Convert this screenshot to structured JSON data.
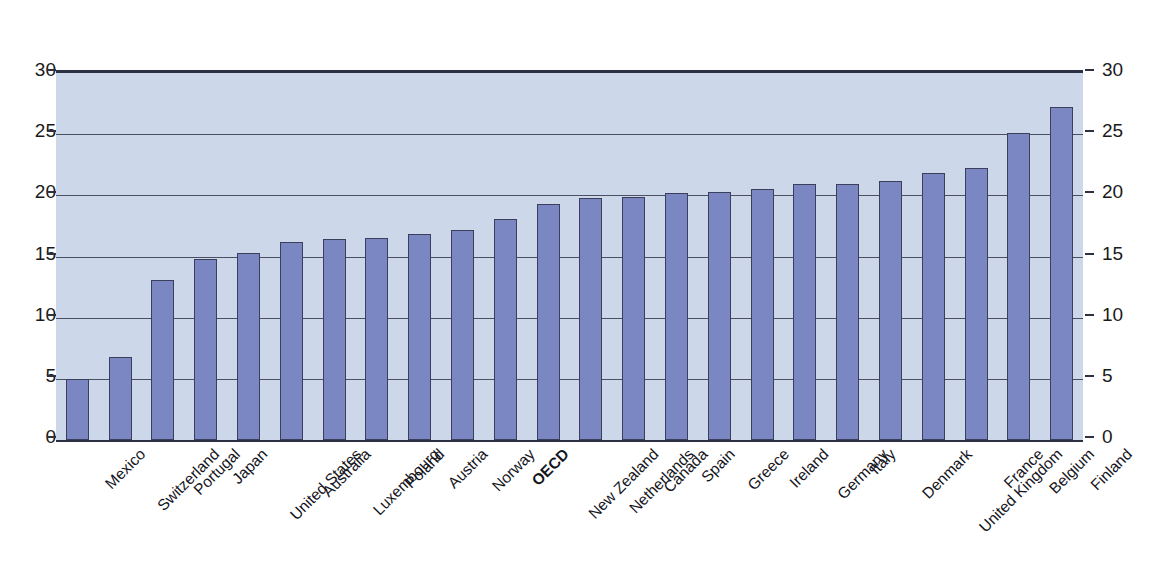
{
  "chart_data": {
    "type": "bar",
    "title": "",
    "subtitle": "",
    "xlabel": "",
    "ylabel": "",
    "ylim": [
      0,
      30
    ],
    "yticks": [
      0,
      5,
      10,
      15,
      20,
      25,
      30
    ],
    "grid": true,
    "legend": "none",
    "dual_axis": true,
    "highlight_category": "OECD",
    "categories": [
      "Mexico",
      "Switzerland",
      "Portugal",
      "Japan",
      "United States",
      "Australia",
      "Luxembourg",
      "Poland",
      "Austria",
      "Norway",
      "OECD",
      "New Zealand",
      "Netherlands",
      "Canada",
      "Spain",
      "Greece",
      "Ireland",
      "Germany",
      "Italy",
      "Denmark",
      "United Kingdom",
      "France",
      "Belgium",
      "Finland"
    ],
    "values": [
      5.0,
      6.8,
      13.1,
      14.8,
      15.3,
      16.2,
      16.4,
      16.5,
      16.8,
      17.2,
      18.1,
      19.3,
      19.8,
      19.9,
      20.2,
      20.3,
      20.5,
      20.9,
      20.9,
      21.2,
      21.8,
      22.2,
      25.1,
      27.2
    ]
  },
  "axes": {
    "left_ticks": [
      "30",
      "25",
      "20",
      "15",
      "10",
      "5",
      "0"
    ],
    "right_ticks": [
      "30",
      "25",
      "20",
      "15",
      "10",
      "5",
      "0"
    ]
  },
  "colors": {
    "plot_background": "#ccd8ea",
    "bar_fill": "#7b87c2",
    "bar_border": "#3b3f5c",
    "gridline": "#4a4f63",
    "axis_frame": "#2d3042",
    "text": "#15151c",
    "page_background": "#ffffff"
  }
}
